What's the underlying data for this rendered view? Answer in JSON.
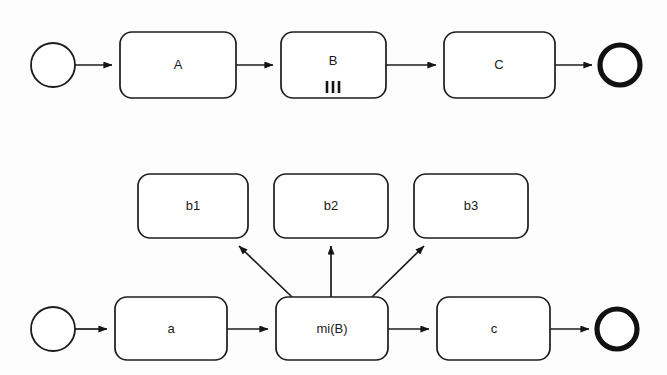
{
  "diagram": {
    "type": "bpmn-process-diagram",
    "title": "",
    "colors": {
      "background": "#fdfdfd",
      "stroke": "#1c1c1c",
      "fill": "#ffffff",
      "text": "#1a1a1a"
    },
    "rows": [
      {
        "id": "collapsed-variant",
        "name": "collapsed-multi-instance-process",
        "start_event": {
          "name": "start-event",
          "label": ""
        },
        "tasks": [
          {
            "id": "task-a",
            "label": "A",
            "marker": "none"
          },
          {
            "id": "task-b",
            "label": "B",
            "marker": "parallel-multi-instance",
            "marker_glyph": "|||",
            "marker_bars": 3
          },
          {
            "id": "task-c",
            "label": "C",
            "marker": "none"
          }
        ],
        "end_event": {
          "name": "end-event",
          "label": ""
        },
        "sequence_flows": [
          {
            "from": "start-event",
            "to": "task-a"
          },
          {
            "from": "task-a",
            "to": "task-b"
          },
          {
            "from": "task-b",
            "to": "task-c"
          },
          {
            "from": "task-c",
            "to": "end-event"
          }
        ]
      },
      {
        "id": "expanded-variant",
        "name": "expanded-multi-instance-process",
        "start_event": {
          "name": "start-event",
          "label": ""
        },
        "tasks": [
          {
            "id": "task-a-lower",
            "label": "a",
            "marker": "none"
          },
          {
            "id": "task-mi-b",
            "label": "mi(B)",
            "marker": "none"
          },
          {
            "id": "task-c-lower",
            "label": "c",
            "marker": "none"
          }
        ],
        "instances": [
          {
            "id": "task-b1",
            "label": "b1"
          },
          {
            "id": "task-b2",
            "label": "b2"
          },
          {
            "id": "task-b3",
            "label": "b3"
          }
        ],
        "end_event": {
          "name": "end-event",
          "label": ""
        },
        "sequence_flows": [
          {
            "from": "start-event",
            "to": "task-a-lower"
          },
          {
            "from": "task-a-lower",
            "to": "task-mi-b"
          },
          {
            "from": "task-mi-b",
            "to": "task-c-lower"
          },
          {
            "from": "task-c-lower",
            "to": "end-event"
          }
        ],
        "instance_flows": [
          {
            "from": "task-mi-b",
            "to": "task-b1"
          },
          {
            "from": "task-mi-b",
            "to": "task-b2"
          },
          {
            "from": "task-mi-b",
            "to": "task-b3"
          }
        ]
      }
    ]
  }
}
